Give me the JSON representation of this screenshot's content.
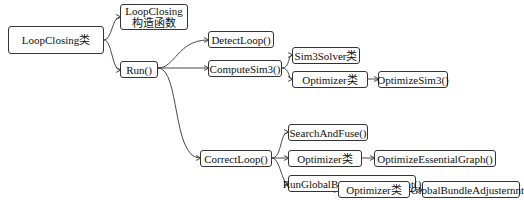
{
  "nodes": {
    "root": "LoopClosing类",
    "ctor": [
      "LoopClosing",
      "构造函数"
    ],
    "run": "Run()",
    "detect": "DetectLoop()",
    "compute": "ComputeSim3()",
    "sim3solver": "Sim3Solver类",
    "optimizer1": "Optimizer类",
    "optimizeSim3": "OptimizeSim3()",
    "correct": "CorrectLoop()",
    "searchfuse": "SearchAndFuse()",
    "optimizer2": "Optimizer类",
    "essential": "OptimizeEssentialGraph()",
    "rungba": "RunGlobalBundleAdjustment()",
    "optimizer3": "Optimizer类",
    "gba": "GlobalBundleAdjusternnt()"
  },
  "colors": {
    "line": "#333333",
    "border": "#333333"
  }
}
